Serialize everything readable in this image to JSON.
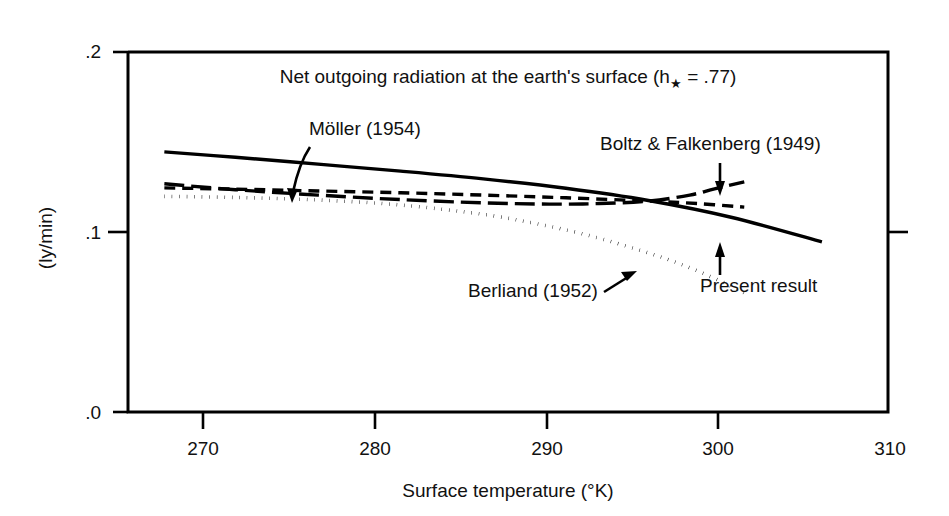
{
  "chart_data": {
    "type": "line",
    "title_main": "Net outgoing radiation at the earth's surface (h",
    "title_sub": "★",
    "title_tail": " = .77)",
    "xlabel": "Surface temperature (°K)",
    "ylabel": "(ly/min)",
    "xlim": [
      265.5,
      311.5
    ],
    "ylim": [
      0.0,
      0.2
    ],
    "xticks": [
      270,
      280,
      290,
      300,
      310
    ],
    "xticklabels": [
      "270",
      "280",
      "290",
      "300",
      "310"
    ],
    "yticks": [
      0.0,
      0.1,
      0.2
    ],
    "yticklabels": [
      ".0",
      ".1",
      ".2"
    ],
    "grid": false,
    "legend": "annotations-with-arrows",
    "series": [
      {
        "name": "Present result",
        "style": "solid",
        "x": [
          267.7,
          272.0,
          277.0,
          282.0,
          287.0,
          292.0,
          297.0,
          302.0,
          307.5
        ],
        "y": [
          0.1445,
          0.1415,
          0.1377,
          0.1338,
          0.1295,
          0.1243,
          0.1175,
          0.1082,
          0.0945
        ]
      },
      {
        "name": "Möller (1954)",
        "style": "dashed",
        "x": [
          267.7,
          272.0,
          277.0,
          282.0,
          287.0,
          292.0,
          297.0,
          300.0,
          302.8
        ],
        "y": [
          0.1245,
          0.1238,
          0.1228,
          0.1218,
          0.1205,
          0.119,
          0.1172,
          0.1158,
          0.1138
        ]
      },
      {
        "name": "Berliand (1952)",
        "style": "dotted",
        "x": [
          267.7,
          272.0,
          277.0,
          282.0,
          287.0,
          290.0,
          293.0,
          296.0,
          299.0,
          302.0,
          303.0
        ],
        "y": [
          0.1198,
          0.1192,
          0.1178,
          0.115,
          0.1098,
          0.105,
          0.099,
          0.0912,
          0.082,
          0.07,
          0.065
        ]
      },
      {
        "name": "Boltz & Falkenberg (1949)",
        "style": "dashdot",
        "x": [
          267.7,
          272.0,
          277.0,
          282.0,
          287.0,
          291.0,
          294.0,
          297.0,
          299.5,
          301.0,
          302.8
        ],
        "y": [
          0.1268,
          0.1235,
          0.1205,
          0.118,
          0.1162,
          0.1155,
          0.1158,
          0.1172,
          0.1205,
          0.124,
          0.1278
        ]
      }
    ],
    "annotations": [
      {
        "label": "Möller (1954)",
        "text_x": 309,
        "text_y": 128,
        "anchor": "start",
        "arrow": "curved-down-left"
      },
      {
        "label": "Boltz & Falkenberg (1949)",
        "text_x": 600,
        "text_y": 150,
        "anchor": "start",
        "arrow": "straight-down"
      },
      {
        "label": "Present result",
        "text_x": 700,
        "text_y": 285,
        "anchor": "start",
        "arrow": "straight-up"
      },
      {
        "label": "Berliand (1952)",
        "text_x": 468,
        "text_y": 297,
        "anchor": "start",
        "arrow": "short-up-right"
      }
    ]
  },
  "colors": {
    "ink": "#000000",
    "background": "#ffffff"
  }
}
